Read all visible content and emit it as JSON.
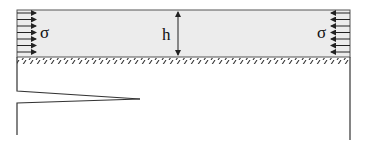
{
  "diagram": {
    "labels": {
      "sigma_left": "σ",
      "sigma_right": "σ",
      "thickness": "h"
    },
    "colors": {
      "layer_fill": "#ececec",
      "stroke": "#333333",
      "background": "#ffffff"
    },
    "arrow_count_per_side": 7
  }
}
